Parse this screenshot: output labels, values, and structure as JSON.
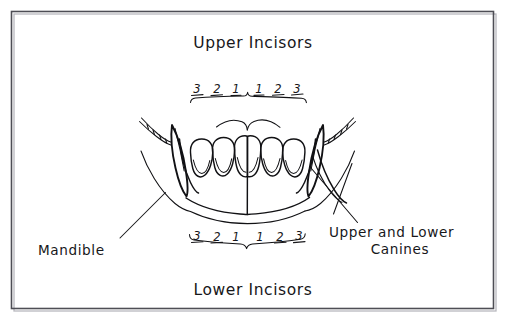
{
  "figure": {
    "kind": "hand-drawn-anatomical-diagram",
    "background_color": "#ffffff",
    "ink_color": "#111114",
    "frame_color": "#4e4e55"
  },
  "labels": {
    "top_title": "Upper  Incisors",
    "bottom_title": "Lower Incisors",
    "left_callout": "Mandible",
    "right_callout_line1": "Upper and Lower",
    "right_callout_line2": "Canines"
  },
  "tooth_numbers": {
    "upper": [
      "3",
      "2",
      "1",
      "1",
      "2",
      "3"
    ],
    "lower": [
      "3",
      "2",
      "1",
      "1",
      "2",
      "3"
    ]
  },
  "brackets": {
    "upper_label": "upper-incisor-bracket",
    "lower_label": "lower-incisor-bracket"
  },
  "anatomy": {
    "upper_incisor_count": 6,
    "lower_arch": "mandible",
    "canine_sides": [
      "left",
      "right"
    ]
  }
}
